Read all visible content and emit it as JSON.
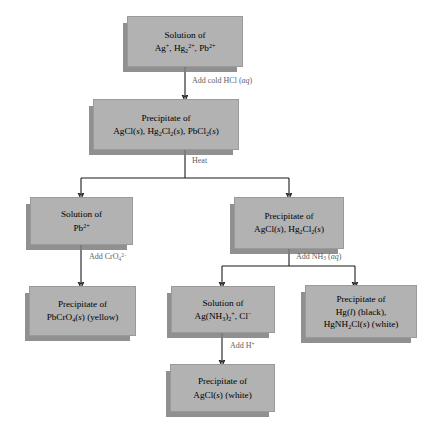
{
  "diagram": {
    "type": "flowchart",
    "box_fill": "#b2b2b2",
    "box_border": "#9a9a9a",
    "shadow_color": "#7d7d7d",
    "label_color": "#5e5e5e",
    "arrow_color": "#1a1a1a",
    "nodes": [
      {
        "id": "n1",
        "name": "solution-ag-hg-pb",
        "line1": "Solution of",
        "line2_html": "Ag<sup>+</sup>, Hg<sub>2</sub><sup>2+</sup>, Pb<sup>2+</sup>",
        "line2_text": "Ag+, Hg2 2+, Pb2+"
      },
      {
        "id": "n2",
        "name": "precipitate-agcl-hg2cl2-pbcl2",
        "line1": "Precipitate of",
        "line2_html": "AgCl(<i>s</i>), Hg<sub>2</sub>Cl<sub>2</sub>(<i>s</i>), PbCl<sub>2</sub>(<i>s</i>)",
        "line2_text": "AgCl(s), Hg2Cl2(s), PbCl2(s)"
      },
      {
        "id": "n3",
        "name": "solution-pb",
        "line1": "Solution of",
        "line2_html": "Pb<sup>2+</sup>",
        "line2_text": "Pb2+"
      },
      {
        "id": "n4",
        "name": "precipitate-agcl-hg2cl2",
        "line1": "Precipitate of",
        "line2_html": "AgCl(<i>s</i>), Hg<sub>2</sub>Cl<sub>2</sub>(<i>s</i>)",
        "line2_text": "AgCl(s), Hg2Cl2(s)"
      },
      {
        "id": "n5",
        "name": "precipitate-pbcro4-yellow",
        "line1": "Precipitate of",
        "line2_html": "PbCrO<sub>4</sub>(<i>s</i>) (yellow)",
        "line2_text": "PbCrO4(s) (yellow)"
      },
      {
        "id": "n6",
        "name": "solution-ag-nh3-complex",
        "line1": "Solution of",
        "line2_html": "Ag(NH<sub>3</sub>)<sub>2</sub><sup>+</sup>, Cl<sup>&minus;</sup>",
        "line2_text": "Ag(NH3)2+, Cl-"
      },
      {
        "id": "n7",
        "name": "precipitate-hg-black-hgnh2cl-white",
        "line1": "Precipitate of",
        "line2_html": "Hg(<i>l</i>) (black),",
        "line2_text": "Hg(l) (black),",
        "line3_html": "HgNH<sub>2</sub>Cl(<i>s</i>) (white)",
        "line3_text": "HgNH2Cl(s) (white)"
      },
      {
        "id": "n8",
        "name": "precipitate-agcl-white",
        "line1": "Precipitate of",
        "line2_html": "AgCl(<i>s</i>) (white)",
        "line2_text": "AgCl(s) (white)"
      }
    ],
    "edge_labels": [
      {
        "id": "e1",
        "name": "edge-label-add-cold-hcl",
        "html": "Add cold HCl (<i>aq</i>)",
        "text": "Add cold HCl (aq)"
      },
      {
        "id": "e2",
        "name": "edge-label-heat",
        "html": "Heat",
        "text": "Heat"
      },
      {
        "id": "e3",
        "name": "edge-label-add-chromate",
        "html": "Add CrO<sub>4</sub><sup>2&minus;</sup>",
        "text": "Add CrO4 2-"
      },
      {
        "id": "e4",
        "name": "edge-label-add-ammonia",
        "html": "Add NH<sub>3</sub> (<i>aq</i>)",
        "text": "Add NH3 (aq)"
      },
      {
        "id": "e5",
        "name": "edge-label-add-acid",
        "html": "Add H<sup>+</sup>",
        "text": "Add H+"
      }
    ]
  }
}
